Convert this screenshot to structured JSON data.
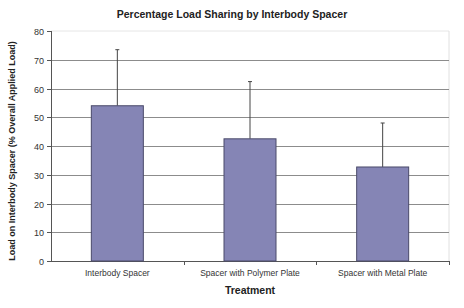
{
  "chart_data": {
    "type": "bar",
    "title": "Percentage Load Sharing by Interbody Spacer",
    "xlabel": "Treatment",
    "ylabel": "Load on Interbody Spacer (% Overall Applied Load)",
    "categories": [
      "Interbody Spacer",
      "Spacer with Polymer Plate",
      "Spacer with Metal Plate"
    ],
    "values": [
      54,
      42.5,
      32.7
    ],
    "error_upper": [
      73.5,
      62.4,
      48
    ],
    "error_plus": [
      19.5,
      19.9,
      15.3
    ],
    "ylim": [
      0,
      80
    ],
    "yticks": [
      0,
      10,
      20,
      30,
      40,
      50,
      60,
      70,
      80
    ],
    "grid": true,
    "legend": "none",
    "bar_color": "#8585b5",
    "bar_edge_color": "#4a4a6a"
  }
}
